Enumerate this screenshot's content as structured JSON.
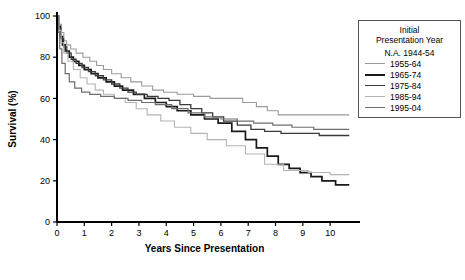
{
  "chart_data": {
    "type": "line",
    "subtype": "kaplan-meier-step",
    "title": "",
    "xlabel": "Years Since Presentation",
    "ylabel": "Survival (%)",
    "xlim": [
      0,
      10.8
    ],
    "ylim": [
      0,
      100
    ],
    "xticks": [
      0,
      1,
      2,
      3,
      4,
      5,
      6,
      7,
      8,
      9,
      10
    ],
    "yticks": [
      0,
      20,
      40,
      60,
      80,
      100
    ],
    "xtick_labels": [
      "0",
      "1",
      "2",
      "3",
      "4",
      "5",
      "6",
      "7",
      "8",
      "9",
      "10"
    ],
    "ytick_labels": [
      "0",
      "20",
      "40",
      "60",
      "80",
      "100"
    ],
    "grid": false,
    "legend_position": "right-outside",
    "legend_title": "Initial Presentation Year",
    "series": [
      {
        "name": "N.A. 1944-54",
        "color": "#ffffff",
        "width": 0,
        "has_line": false,
        "points": []
      },
      {
        "name": "1955-64",
        "color": "#9a9a9a",
        "width": 1.1,
        "has_line": true,
        "points": [
          [
            0,
            100
          ],
          [
            0.08,
            96
          ],
          [
            0.16,
            92
          ],
          [
            0.25,
            88
          ],
          [
            0.35,
            86
          ],
          [
            0.5,
            84
          ],
          [
            0.7,
            82
          ],
          [
            0.95,
            80
          ],
          [
            1.2,
            78
          ],
          [
            1.45,
            76
          ],
          [
            1.7,
            74
          ],
          [
            2.0,
            72
          ],
          [
            2.35,
            70
          ],
          [
            2.7,
            68
          ],
          [
            3.1,
            66
          ],
          [
            3.5,
            64
          ],
          [
            3.9,
            63
          ],
          [
            4.4,
            62
          ],
          [
            5.0,
            61
          ],
          [
            5.6,
            60
          ],
          [
            6.3,
            60
          ],
          [
            6.8,
            58
          ],
          [
            7.3,
            56
          ],
          [
            7.7,
            54
          ],
          [
            8.1,
            52
          ],
          [
            10.7,
            52
          ]
        ]
      },
      {
        "name": "1965-74",
        "color": "#1a1a1a",
        "width": 1.7,
        "has_line": true,
        "points": [
          [
            0,
            100
          ],
          [
            0.05,
            95
          ],
          [
            0.12,
            90
          ],
          [
            0.2,
            86
          ],
          [
            0.3,
            83
          ],
          [
            0.45,
            80
          ],
          [
            0.6,
            78
          ],
          [
            0.8,
            76
          ],
          [
            1.0,
            74
          ],
          [
            1.25,
            72
          ],
          [
            1.5,
            70
          ],
          [
            1.8,
            68
          ],
          [
            2.1,
            66
          ],
          [
            2.4,
            64
          ],
          [
            2.8,
            62
          ],
          [
            3.2,
            60
          ],
          [
            3.6,
            58
          ],
          [
            4.0,
            56
          ],
          [
            4.4,
            54
          ],
          [
            4.9,
            52
          ],
          [
            5.4,
            50
          ],
          [
            5.9,
            48
          ],
          [
            6.4,
            44
          ],
          [
            6.9,
            40
          ],
          [
            7.3,
            36
          ],
          [
            7.7,
            32
          ],
          [
            8.1,
            28
          ],
          [
            8.5,
            26
          ],
          [
            8.9,
            24
          ],
          [
            9.3,
            22
          ],
          [
            9.7,
            20
          ],
          [
            10.2,
            18
          ],
          [
            10.7,
            18
          ]
        ]
      },
      {
        "name": "1975-84",
        "color": "#3a3a3a",
        "width": 1.3,
        "has_line": true,
        "points": [
          [
            0,
            100
          ],
          [
            0.06,
            94
          ],
          [
            0.14,
            89
          ],
          [
            0.24,
            85
          ],
          [
            0.36,
            82
          ],
          [
            0.52,
            79
          ],
          [
            0.7,
            77
          ],
          [
            0.92,
            75
          ],
          [
            1.15,
            73
          ],
          [
            1.4,
            71
          ],
          [
            1.7,
            69
          ],
          [
            2.0,
            67
          ],
          [
            2.3,
            65
          ],
          [
            2.6,
            63
          ],
          [
            2.9,
            62
          ],
          [
            3.3,
            61
          ],
          [
            3.7,
            60
          ],
          [
            4.1,
            59
          ],
          [
            4.5,
            57
          ],
          [
            4.9,
            55
          ],
          [
            5.3,
            53
          ],
          [
            5.7,
            51
          ],
          [
            6.1,
            49
          ],
          [
            6.6,
            47
          ],
          [
            7.1,
            45
          ],
          [
            7.6,
            44
          ],
          [
            8.2,
            43
          ],
          [
            9.0,
            43
          ],
          [
            9.6,
            42
          ],
          [
            10.7,
            42
          ]
        ]
      },
      {
        "name": "1985-94",
        "color": "#b4b4b4",
        "width": 1.1,
        "has_line": true,
        "points": [
          [
            0,
            100
          ],
          [
            0.07,
            93
          ],
          [
            0.15,
            87
          ],
          [
            0.25,
            82
          ],
          [
            0.4,
            78
          ],
          [
            0.6,
            74
          ],
          [
            0.85,
            70
          ],
          [
            1.1,
            67
          ],
          [
            1.4,
            64
          ],
          [
            1.7,
            62
          ],
          [
            2.1,
            60
          ],
          [
            2.5,
            58
          ],
          [
            2.9,
            55
          ],
          [
            3.3,
            52
          ],
          [
            3.8,
            49
          ],
          [
            4.3,
            46
          ],
          [
            4.9,
            43
          ],
          [
            5.5,
            40
          ],
          [
            6.2,
            37
          ],
          [
            6.9,
            33
          ],
          [
            7.6,
            28
          ],
          [
            8.3,
            25
          ],
          [
            9.2,
            24
          ],
          [
            10.0,
            23
          ],
          [
            10.7,
            23
          ]
        ]
      },
      {
        "name": "1995-04",
        "color": "#6e6e6e",
        "width": 1.2,
        "has_line": true,
        "points": [
          [
            0,
            100
          ],
          [
            0.04,
            92
          ],
          [
            0.1,
            84
          ],
          [
            0.18,
            77
          ],
          [
            0.3,
            72
          ],
          [
            0.45,
            68
          ],
          [
            0.65,
            65
          ],
          [
            0.9,
            63
          ],
          [
            1.2,
            62
          ],
          [
            1.6,
            61
          ],
          [
            2.1,
            60
          ],
          [
            2.6,
            59
          ],
          [
            3.1,
            58
          ],
          [
            3.6,
            57
          ],
          [
            4.2,
            55
          ],
          [
            4.8,
            53
          ],
          [
            5.4,
            51
          ],
          [
            6.0,
            50
          ],
          [
            6.6,
            49
          ],
          [
            7.2,
            48
          ],
          [
            7.9,
            47
          ],
          [
            8.6,
            46
          ],
          [
            9.4,
            45
          ],
          [
            10.7,
            45
          ]
        ]
      }
    ]
  },
  "legend": {
    "title_line1": "Initial",
    "title_line2": "Presentation Year",
    "entries": [
      {
        "label": "N.A. 1944-54",
        "swatch": false
      },
      {
        "label": "1955-64",
        "swatch": true
      },
      {
        "label": "1965-74",
        "swatch": true
      },
      {
        "label": "1975-84",
        "swatch": true
      },
      {
        "label": "1985-94",
        "swatch": true
      },
      {
        "label": "1995-04",
        "swatch": true
      }
    ]
  }
}
